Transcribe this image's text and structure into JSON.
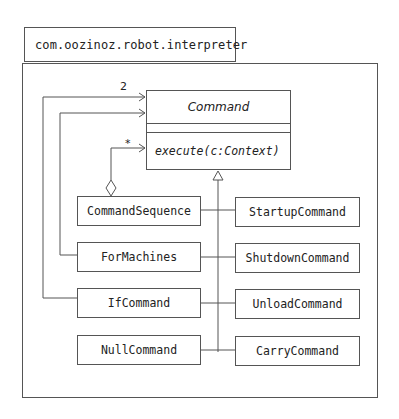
{
  "package": {
    "name": "com.oozinoz.robot.interpreter"
  },
  "abstract_class": {
    "name": "Command",
    "operations": [
      "execute(c:Context)"
    ]
  },
  "multiplicities": {
    "if_command_refs": "2",
    "sequence_refs": "*"
  },
  "subclasses": {
    "left": [
      {
        "name": "CommandSequence"
      },
      {
        "name": "ForMachines"
      },
      {
        "name": "IfCommand"
      },
      {
        "name": "NullCommand"
      }
    ],
    "right": [
      {
        "name": "StartupCommand"
      },
      {
        "name": "ShutdownCommand"
      },
      {
        "name": "UnloadCommand"
      },
      {
        "name": "CarryCommand"
      }
    ]
  },
  "colors": {
    "line": "#555555",
    "text": "#222222",
    "background": "#ffffff"
  }
}
